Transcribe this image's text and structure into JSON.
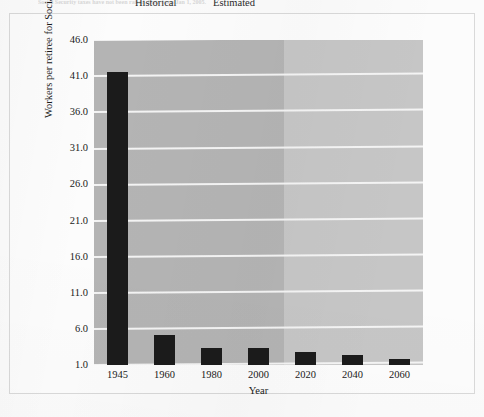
{
  "caption": {
    "text": "Social Security taxes have not been raised. Data from Jan 1, 2005."
  },
  "chart_data": {
    "type": "bar",
    "title": "",
    "xlabel": "Year",
    "ylabel": "Workers per retiree for Social Security",
    "categories": [
      "1945",
      "1960",
      "1980",
      "2000",
      "2020",
      "2040",
      "2060"
    ],
    "values": [
      41.6,
      5.2,
      3.4,
      3.4,
      2.8,
      2.4,
      1.9
    ],
    "ylim": [
      1.0,
      46.0
    ],
    "yticks": [
      "46.0",
      "41.0",
      "36.0",
      "31.0",
      "26.0",
      "21.0",
      "16.0",
      "11.0",
      "6.0",
      "1.0"
    ],
    "ytick_values": [
      46.0,
      41.0,
      36.0,
      31.0,
      26.0,
      21.0,
      16.0,
      11.0,
      6.0,
      1.0
    ],
    "grid": true,
    "legend": "none",
    "regions": [
      {
        "label": "Historical",
        "from": "1945",
        "to": "2000",
        "color": "#b4b4b4"
      },
      {
        "label": "Estimated",
        "from": "2020",
        "to": "2060",
        "color": "#c6c6c6"
      }
    ],
    "bar_color": "#1b1b1b",
    "gridline_color": "#f4f4f4"
  }
}
